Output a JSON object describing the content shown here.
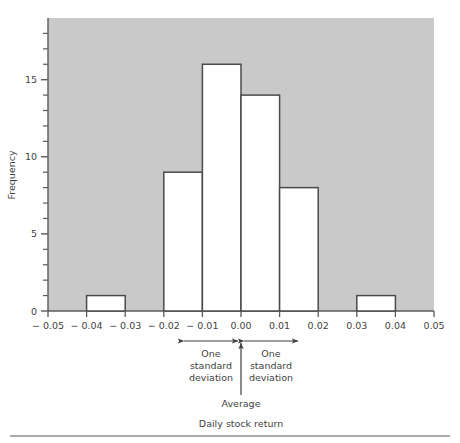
{
  "chart_data": {
    "type": "bar",
    "title": "",
    "subtitle": "",
    "xlabel": "Daily stock return",
    "ylabel": "Frequency",
    "xlim": [
      -0.05,
      0.05
    ],
    "ylim": [
      0,
      19
    ],
    "bin_width": 0.01,
    "grid": false,
    "legend": null,
    "x_tick_labels": [
      "− 0.05",
      "− 0.04",
      "− 0.03",
      "− 0.02",
      "− 0.01",
      "0.00",
      "0.01",
      "0.02",
      "0.03",
      "0.04",
      "0.05"
    ],
    "x_tick_values": [
      -0.05,
      -0.04,
      -0.03,
      -0.02,
      -0.01,
      0.0,
      0.01,
      0.02,
      0.03,
      0.04,
      0.05
    ],
    "y_tick_labels": [
      "0",
      "5",
      "10",
      "15"
    ],
    "y_tick_values": [
      0,
      5,
      10,
      15
    ],
    "y_minor_tick_values": [
      1,
      2,
      3,
      4,
      6,
      7,
      8,
      9,
      11,
      12,
      13,
      14,
      16,
      17,
      18
    ],
    "bins": [
      {
        "left": -0.05,
        "right": -0.04,
        "value": 0
      },
      {
        "left": -0.04,
        "right": -0.03,
        "value": 1
      },
      {
        "left": -0.03,
        "right": -0.02,
        "value": 0
      },
      {
        "left": -0.02,
        "right": -0.01,
        "value": 9
      },
      {
        "left": -0.01,
        "right": 0.0,
        "value": 16
      },
      {
        "left": 0.0,
        "right": 0.01,
        "value": 14
      },
      {
        "left": 0.01,
        "right": 0.02,
        "value": 8
      },
      {
        "left": 0.02,
        "right": 0.03,
        "value": 0
      },
      {
        "left": 0.03,
        "right": 0.04,
        "value": 1
      },
      {
        "left": 0.04,
        "right": 0.05,
        "value": 0
      }
    ],
    "categories": [
      "-0.05 to -0.04",
      "-0.04 to -0.03",
      "-0.03 to -0.02",
      "-0.02 to -0.01",
      "-0.01 to 0.00",
      "0.00 to 0.01",
      "0.01 to 0.02",
      "0.02 to 0.03",
      "0.03 to 0.04",
      "0.04 to 0.05"
    ],
    "values": [
      0,
      1,
      0,
      9,
      16,
      14,
      8,
      0,
      1,
      0
    ],
    "annotations": {
      "average_label": "Average",
      "average_x": 0.0,
      "left_sd_label_line1": "One",
      "left_sd_label_line2": "standard",
      "left_sd_label_line3": "deviation",
      "right_sd_label_line1": "One",
      "right_sd_label_line2": "standard",
      "right_sd_label_line3": "deviation",
      "left_sd_span": [
        -0.015,
        0.0
      ],
      "right_sd_span": [
        0.0,
        0.015
      ]
    },
    "colors": {
      "plot_background": "#c9c9c9",
      "bar_fill": "#ffffff",
      "bar_stroke": "#4a4a4a",
      "axis": "#5a5a5a",
      "text": "#3f3f3f",
      "page_background": "#ffffff",
      "rule": "#8d8d8d"
    }
  },
  "caption": {
    "x_axis_caption": "Daily stock return"
  }
}
